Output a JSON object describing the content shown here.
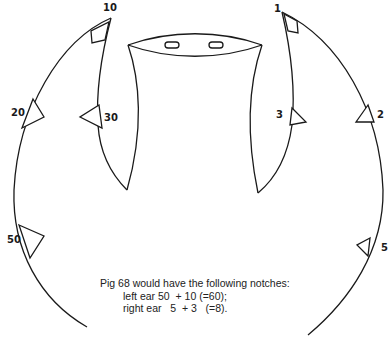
{
  "diagram": {
    "type": "ear-notching-diagram",
    "left_ear": {
      "notches": [
        {
          "label": "10",
          "position": "tip"
        },
        {
          "label": "20",
          "position": "outer edge upper"
        },
        {
          "label": "30",
          "position": "inner edge"
        },
        {
          "label": "50",
          "position": "outer edge lower"
        }
      ]
    },
    "right_ear": {
      "notches": [
        {
          "label": "1",
          "position": "tip"
        },
        {
          "label": "2",
          "position": "outer edge upper"
        },
        {
          "label": "3",
          "position": "inner edge"
        },
        {
          "label": "5",
          "position": "outer edge lower"
        }
      ]
    },
    "caption": {
      "line1": "Pig 68 would have the following notches:",
      "line2": "left ear 50  + 10 (=60);",
      "line3": "right ear   5  + 3   (=8)."
    },
    "stroke_color": "#1a1a1a",
    "background": "#ffffff"
  }
}
